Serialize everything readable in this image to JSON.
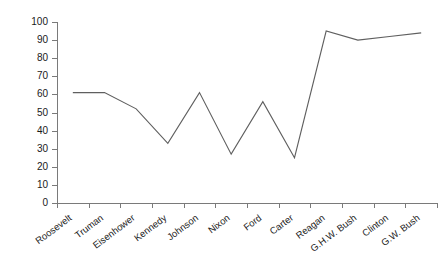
{
  "chart_data": {
    "type": "line",
    "title": "",
    "subtitle": "",
    "xlabel": "",
    "ylabel": "",
    "categories": [
      "Roosevelt",
      "Truman",
      "Eisenhower",
      "Kennedy",
      "Johnson",
      "Nixon",
      "Ford",
      "Carter",
      "Reagan",
      "G.H.W. Bush",
      "Clinton",
      "G.W. Bush"
    ],
    "values": [
      61,
      61,
      52,
      33,
      61,
      27,
      56,
      25,
      95,
      90,
      92,
      94
    ],
    "series": [
      {
        "name": "",
        "values": [
          61,
          61,
          52,
          33,
          61,
          27,
          56,
          25,
          95,
          90,
          92,
          94
        ]
      }
    ],
    "ylim": [
      0,
      100
    ],
    "y_ticks": [
      0,
      10,
      20,
      30,
      40,
      50,
      60,
      70,
      80,
      90,
      100
    ],
    "y_tick_labels": [
      "0",
      "10",
      "20",
      "30",
      "40",
      "50",
      "60",
      "70",
      "80",
      "90",
      "100"
    ],
    "grid": false,
    "legend": false,
    "legend_position": "none",
    "line_color": "#5f5f5f",
    "axis_color": "#7a7a7a",
    "background_color": "#ffffff",
    "text_color": "#1a1a1a",
    "markers": false,
    "annotations": []
  }
}
